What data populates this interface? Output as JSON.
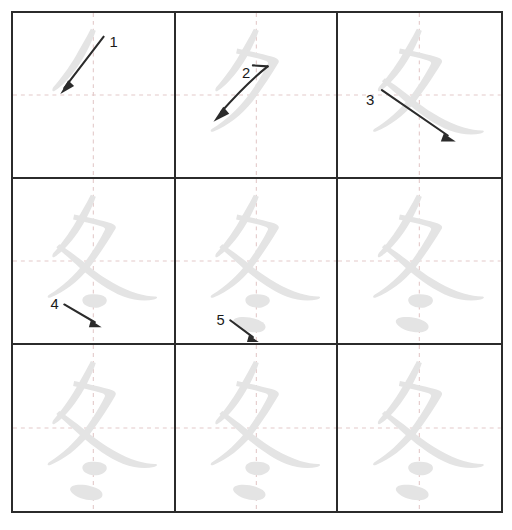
{
  "diagram": {
    "character": "冬",
    "character_meaning": "winter",
    "total_strokes": 5,
    "grid": {
      "rows": 3,
      "columns": 3,
      "cells": 9
    },
    "colors": {
      "border": "#2b2b2b",
      "guide_line": "#e3c9c9",
      "glyph": "#e4e4e4",
      "arrow": "#2b2b2b",
      "background": "#ffffff"
    },
    "cells": [
      {
        "index": 1,
        "position": "row-1-col-1",
        "strokes_shown": 1,
        "arrow_label": "1",
        "arrow_direction": "down-left",
        "label_x": 98,
        "label_y": 34,
        "has_arrow": true
      },
      {
        "index": 2,
        "position": "row-1-col-2",
        "strokes_shown": 2,
        "arrow_label": "2",
        "arrow_direction": "curve-down-left",
        "label_x": 67,
        "label_y": 66,
        "has_arrow": true
      },
      {
        "index": 3,
        "position": "row-1-col-3",
        "strokes_shown": 3,
        "arrow_label": "3",
        "arrow_direction": "down-right",
        "label_x": 41,
        "label_y": 93,
        "has_arrow": true
      },
      {
        "index": 4,
        "position": "row-2-col-1",
        "strokes_shown": 4,
        "arrow_label": "4",
        "arrow_direction": "down-right",
        "label_x": 61,
        "label_y": 137,
        "has_arrow": true
      },
      {
        "index": 5,
        "position": "row-2-col-2",
        "strokes_shown": 5,
        "arrow_label": "5",
        "arrow_direction": "down-right",
        "label_x": 45,
        "label_y": 155,
        "has_arrow": true
      },
      {
        "index": 6,
        "position": "row-2-col-3",
        "strokes_shown": 5,
        "arrow_label": "",
        "arrow_direction": "",
        "has_arrow": false
      },
      {
        "index": 7,
        "position": "row-3-col-1",
        "strokes_shown": 5,
        "arrow_label": "",
        "arrow_direction": "",
        "has_arrow": false
      },
      {
        "index": 8,
        "position": "row-3-col-2",
        "strokes_shown": 5,
        "arrow_label": "",
        "arrow_direction": "",
        "has_arrow": false
      },
      {
        "index": 9,
        "position": "row-3-col-3",
        "strokes_shown": 5,
        "arrow_label": "",
        "arrow_direction": "",
        "has_arrow": false
      }
    ]
  }
}
